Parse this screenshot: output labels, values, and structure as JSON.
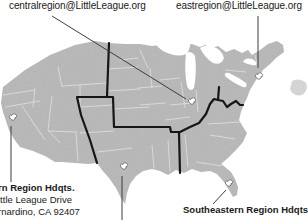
{
  "labels": {
    "central_region_email": "centralregion@LittleLeague.org",
    "east_region_email": "eastregion@LittleLeague.org",
    "western_hq_line1": "rn Region Hdqts.",
    "western_hq_line2": "ittle League Drive",
    "western_hq_line3": "rnardino, CA  92407",
    "southeastern_hq": "Southeastern Region Hdqts."
  },
  "map": {
    "colors": {
      "land": "#b8b8b8",
      "coast_fragment": "#c9c9c9",
      "state_border": "#e7e7e7",
      "region_boundary": "#161616",
      "pointer_line": "#3d3d3d",
      "marker_fill": "#ffffff",
      "marker_outline": "#5a5a5a",
      "text": "#1a1a1a"
    },
    "markers": [
      {
        "name": "western-region-hq",
        "x": 13,
        "y": 117
      },
      {
        "name": "central-region-hq",
        "x": 192,
        "y": 101
      },
      {
        "name": "eastern-region-hq",
        "x": 259,
        "y": 76
      },
      {
        "name": "southwestern-region-hq",
        "x": 124,
        "y": 166
      },
      {
        "name": "southeastern-region-hq",
        "x": 229,
        "y": 183
      }
    ]
  }
}
